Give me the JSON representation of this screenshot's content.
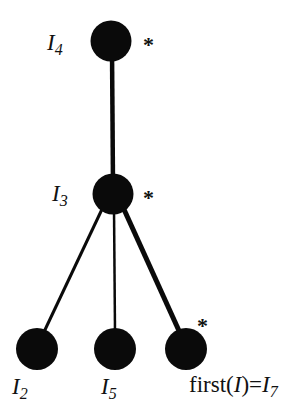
{
  "diagram": {
    "type": "tree",
    "colors": {
      "node": "#0a0a0a",
      "edge": "#0a0a0a",
      "text": "#111111",
      "background": "#ffffff"
    },
    "nodes": [
      {
        "id": "I4",
        "label_main": "I",
        "label_sub": "4",
        "marked": true,
        "star": "*"
      },
      {
        "id": "I3",
        "label_main": "I",
        "label_sub": "3",
        "marked": true,
        "star": "*"
      },
      {
        "id": "I2",
        "label_main": "I",
        "label_sub": "2",
        "marked": false
      },
      {
        "id": "I5",
        "label_main": "I",
        "label_sub": "5",
        "marked": false
      },
      {
        "id": "I7",
        "label_prefix": "first(",
        "label_arg": "I",
        "label_mid": ")=",
        "label_main": "I",
        "label_sub": "7",
        "marked": true,
        "star": "*"
      }
    ],
    "edges": [
      {
        "from": "I4",
        "to": "I3",
        "emphasized": true
      },
      {
        "from": "I3",
        "to": "I2",
        "emphasized": false
      },
      {
        "from": "I3",
        "to": "I5",
        "emphasized": false
      },
      {
        "from": "I3",
        "to": "I7",
        "emphasized": true
      }
    ]
  }
}
